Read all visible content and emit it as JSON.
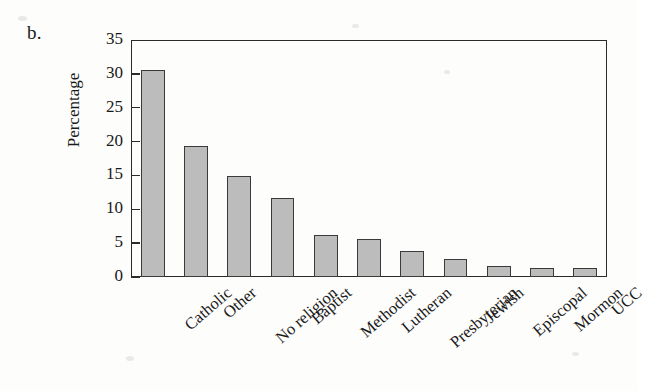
{
  "panel": {
    "label": "b."
  },
  "chart_data": {
    "type": "bar",
    "title": "",
    "xlabel": "",
    "ylabel": "Percentage",
    "ylim": [
      0,
      35
    ],
    "yticks": [
      0,
      5,
      10,
      15,
      20,
      25,
      30,
      35
    ],
    "ytick_labels": [
      "0",
      "5",
      "10",
      "15",
      "20",
      "25",
      "30",
      "35"
    ],
    "grid": false,
    "legend": false,
    "categories": [
      "Catholic",
      "Other",
      "No religion",
      "Baptist",
      "Methodist",
      "Lutheran",
      "Presbyterian",
      "Jewish",
      "Episcopal",
      "Mormon",
      "UCC"
    ],
    "values": [
      30.5,
      19.3,
      14.9,
      11.6,
      6.2,
      5.6,
      3.9,
      2.6,
      1.7,
      1.4,
      1.3
    ],
    "bar_color": "#bcbcbc",
    "bar_edge_color": "#3a3a3a",
    "axis_color": "#2b2b2b",
    "background_color": "#fdfdfc"
  }
}
